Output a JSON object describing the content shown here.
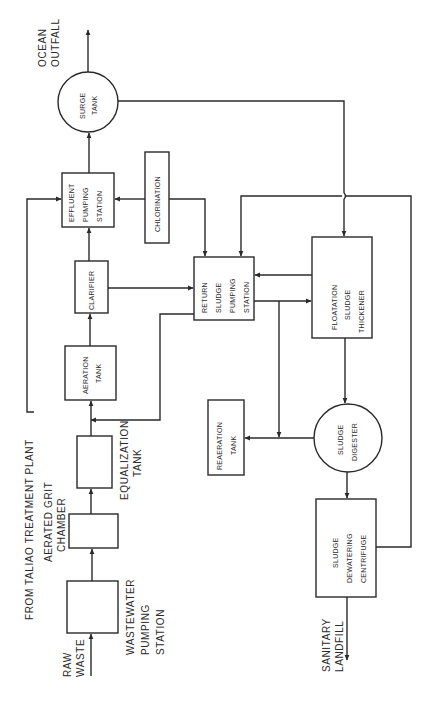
{
  "diagram": {
    "title": "FROM TALIAO TREATMENT PLANT",
    "orientation": "rotated 90 degrees counter-clockwise",
    "nodes": {
      "raw_waste": {
        "lines": [
          "RAW",
          "WASTE"
        ]
      },
      "wastewater_pumping": {
        "lines": [
          "WASTEWATER",
          "PUMPING",
          "STATION"
        ]
      },
      "grit_chamber": {
        "lines": [
          "AERATED GRIT",
          "CHAMBER"
        ]
      },
      "equalization": {
        "lines": [
          "EQUALIZATION",
          "TANK"
        ]
      },
      "aeration": {
        "lines": [
          "AERATION",
          "TANK"
        ]
      },
      "clarifier": {
        "lines": [
          "CLARIFIER"
        ]
      },
      "effluent_pumping": {
        "lines": [
          "EFFLUENT",
          "PUMPING",
          "STATION"
        ]
      },
      "chlorination": {
        "lines": [
          "CHLORINATION"
        ]
      },
      "surge_tank": {
        "lines": [
          "SURGE",
          "TANK"
        ]
      },
      "ocean_outfall": {
        "lines": [
          "OCEAN",
          "OUTFALL"
        ]
      },
      "return_sludge": {
        "lines": [
          "RETURN",
          "SLUDGE",
          "PUMPING",
          "STATION"
        ]
      },
      "floatation": {
        "lines": [
          "FLOATATION",
          "SLUDGE",
          "THICKENER"
        ]
      },
      "reaeration": {
        "lines": [
          "REAERATION",
          "TANK"
        ]
      },
      "digester": {
        "lines": [
          "SLUDGE",
          "DIGESTER"
        ]
      },
      "centrifuge": {
        "lines": [
          "SLUDGE",
          "DEWATERING",
          "CENTRIFUGE"
        ]
      },
      "landfill": {
        "lines": [
          "SANITARY",
          "LANDFILL"
        ]
      }
    },
    "edges": [
      [
        "RAW WASTE",
        "WASTEWATER PUMPING STATION"
      ],
      [
        "WASTEWATER PUMPING STATION",
        "AERATED GRIT CHAMBER"
      ],
      [
        "AERATED GRIT CHAMBER",
        "EQUALIZATION TANK"
      ],
      [
        "EQUALIZATION TANK",
        "AERATION TANK"
      ],
      [
        "AERATION TANK",
        "CLARIFIER"
      ],
      [
        "CLARIFIER",
        "EFFLUENT PUMPING STATION"
      ],
      [
        "CLARIFIER",
        "RETURN SLUDGE PUMPING STATION"
      ],
      [
        "FROM TALIAO TREATMENT PLANT",
        "EFFLUENT PUMPING STATION"
      ],
      [
        "CHLORINATION",
        "EFFLUENT PUMPING STATION"
      ],
      [
        "CHLORINATION",
        "RETURN SLUDGE PUMPING STATION"
      ],
      [
        "EFFLUENT PUMPING STATION",
        "SURGE TANK"
      ],
      [
        "SURGE TANK",
        "OCEAN OUTFALL"
      ],
      [
        "SURGE TANK",
        "FLOATATION SLUDGE THICKENER"
      ],
      [
        "RETURN SLUDGE PUMPING STATION",
        "AERATION TANK"
      ],
      [
        "RETURN SLUDGE PUMPING STATION",
        "FLOATATION SLUDGE THICKENER"
      ],
      [
        "FLOATATION SLUDGE THICKENER",
        "RETURN SLUDGE PUMPING STATION"
      ],
      [
        "FLOATATION SLUDGE THICKENER",
        "SLUDGE DIGESTER"
      ],
      [
        "RETURN SLUDGE PUMPING STATION",
        "REAERATION TANK"
      ],
      [
        "SLUDGE DIGESTER",
        "REAERATION TANK"
      ],
      [
        "SLUDGE DIGESTER",
        "SLUDGE DEWATERING CENTRIFUGE"
      ],
      [
        "SLUDGE DEWATERING CENTRIFUGE",
        "SANITARY LANDFILL"
      ],
      [
        "SLUDGE DEWATERING CENTRIFUGE",
        "RETURN SLUDGE PUMPING STATION"
      ]
    ]
  }
}
